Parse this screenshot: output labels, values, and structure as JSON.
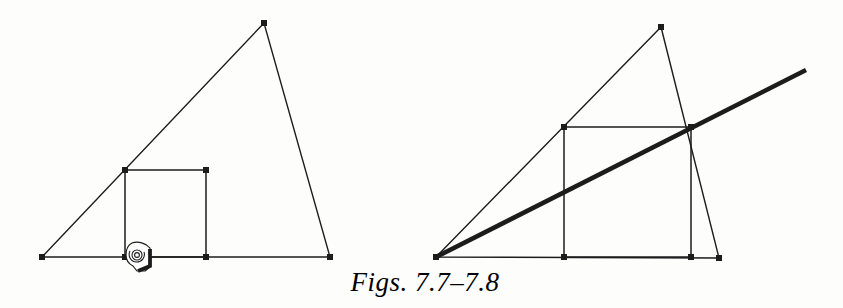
{
  "caption": {
    "text": "Figs. 7.7–7.8"
  },
  "colors": {
    "ink": "#1c1c1c",
    "paper": "#fdfdfc"
  },
  "figures": [
    {
      "id": "fig-7-7",
      "triangle": [
        [
          264,
          23
        ],
        [
          42,
          257
        ],
        [
          330,
          257
        ]
      ],
      "square": [
        [
          125,
          170
        ],
        [
          206,
          170
        ],
        [
          206,
          257
        ],
        [
          125,
          257
        ]
      ],
      "markers": [
        [
          264,
          23
        ],
        [
          42,
          257
        ],
        [
          330,
          257
        ],
        [
          125,
          170
        ],
        [
          206,
          170
        ],
        [
          206,
          257
        ],
        [
          125,
          257
        ]
      ],
      "cursor": {
        "icon": "hand-cursor-icon",
        "x": 126,
        "y": 242
      }
    },
    {
      "id": "fig-7-8",
      "triangle": [
        [
          661,
          27
        ],
        [
          436,
          257
        ],
        [
          719,
          258
        ]
      ],
      "square": [
        [
          564,
          127
        ],
        [
          691,
          127
        ],
        [
          691,
          257
        ],
        [
          564,
          257
        ]
      ],
      "thick_line": [
        [
          436,
          257
        ],
        [
          806,
          70
        ]
      ],
      "markers": [
        [
          661,
          27
        ],
        [
          436,
          257
        ],
        [
          719,
          258
        ],
        [
          564,
          127
        ],
        [
          691,
          127
        ],
        [
          564,
          257
        ],
        [
          691,
          257
        ]
      ]
    }
  ]
}
